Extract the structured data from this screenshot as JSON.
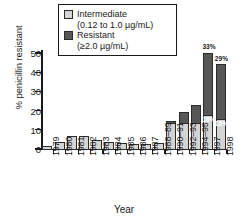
{
  "chart_data": {
    "type": "bar",
    "title": "",
    "xlabel": "Year",
    "ylabel": "% penicillin resistant",
    "ylim": [
      0,
      55
    ],
    "yticks": [
      0,
      10,
      20,
      30,
      40,
      50
    ],
    "grid": false,
    "stacked": true,
    "legend_position": "top-center",
    "categories": [
      "1979",
      "1980",
      "1981",
      "1982",
      "1983",
      "1984",
      "1985",
      "1986",
      "1987",
      "1988–89",
      "1990–91",
      "1992–93",
      "1994–95",
      "1997",
      "1998"
    ],
    "series": [
      {
        "name": "Intermediate",
        "sublabel": "(0.12 to 1.0 µg/mL)",
        "color": "#d4d4d4",
        "values": [
          2,
          4,
          7,
          7,
          5,
          4,
          3.5,
          3,
          3,
          3.5,
          14,
          14,
          14,
          18,
          16
        ]
      },
      {
        "name": "Resistant",
        "sublabel": "(≥2.0 µg/mL)",
        "color": "#575757",
        "values": [
          0,
          0,
          0,
          0,
          0,
          0,
          0,
          0,
          0,
          0,
          1.5,
          6,
          10,
          33,
          29
        ]
      }
    ],
    "totals": [
      2,
      4,
      7,
      7,
      5,
      4,
      3.5,
      3,
      3,
      3.5,
      15.5,
      20,
      24,
      51,
      45
    ],
    "annotations": [
      {
        "text": "33%",
        "category": "1997",
        "series": "Resistant",
        "style": "above-bar"
      },
      {
        "text": "29%",
        "category": "1998",
        "series": "Resistant",
        "style": "above-bar"
      },
      {
        "text": "18%",
        "category": "1997",
        "series": "Intermediate",
        "style": "in-bar"
      },
      {
        "text": "16%",
        "category": "1998",
        "series": "Intermediate",
        "style": "in-bar"
      }
    ]
  },
  "legend": {
    "items": [
      {
        "label": "Intermediate",
        "sublabel": "(0.12 to 1.0 µg/mL)",
        "swatch": "intermediate-swatch"
      },
      {
        "label": "Resistant",
        "sublabel": "(≥2.0 µg/mL)",
        "swatch": "resistant-swatch"
      }
    ]
  },
  "axes": {
    "y_title": "% penicillin resistant",
    "x_title": "Year",
    "y_tick_labels": [
      "0",
      "10",
      "20",
      "30",
      "40",
      "50"
    ],
    "x_tick_labels": [
      "1979",
      "1980",
      "1981",
      "1982",
      "1983",
      "1984",
      "1985",
      "1986",
      "1987",
      "1988–89",
      "1990–91",
      "1992–93",
      "1994–95",
      "1997",
      "1998"
    ]
  }
}
